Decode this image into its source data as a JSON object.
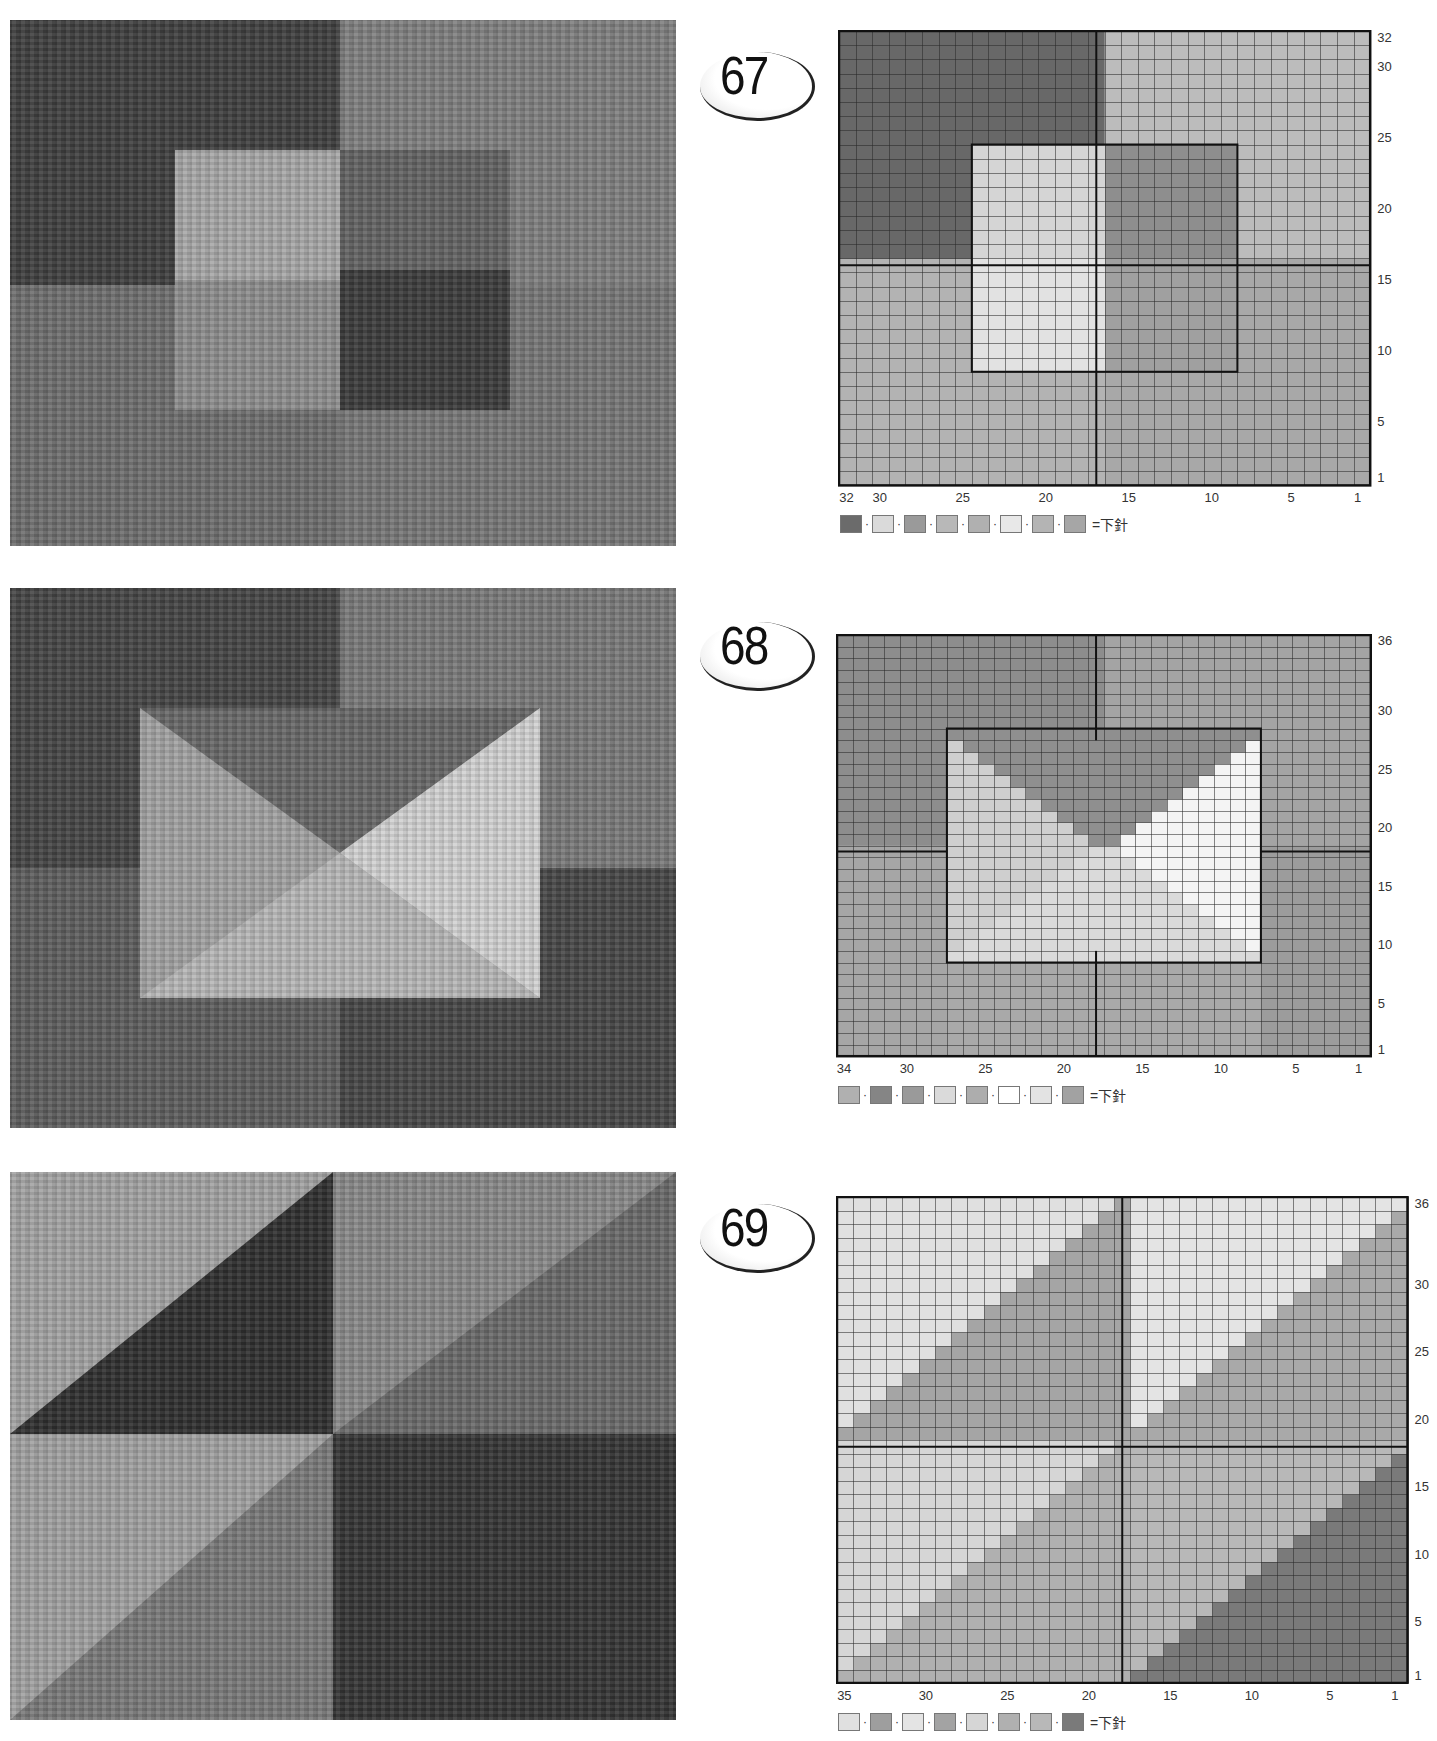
{
  "photos": [
    {
      "id": "photo-67",
      "top": 20,
      "height": 526,
      "blocks": [
        {
          "x": 0,
          "y": 0,
          "w": 330,
          "h": 265,
          "c": "#3f3f3f"
        },
        {
          "x": 330,
          "y": 0,
          "w": 336,
          "h": 265,
          "c": "#808080"
        },
        {
          "x": 0,
          "y": 265,
          "w": 330,
          "h": 261,
          "c": "#6e6e6e"
        },
        {
          "x": 330,
          "y": 265,
          "w": 336,
          "h": 261,
          "c": "#777777"
        },
        {
          "x": 165,
          "y": 130,
          "w": 165,
          "h": 130,
          "c": "#a8a8a8"
        },
        {
          "x": 165,
          "y": 260,
          "w": 165,
          "h": 130,
          "c": "#8e8e8e"
        },
        {
          "x": 330,
          "y": 130,
          "w": 170,
          "h": 120,
          "c": "#636363"
        },
        {
          "x": 330,
          "y": 250,
          "w": 170,
          "h": 140,
          "c": "#3c3c3c"
        }
      ]
    },
    {
      "id": "photo-68",
      "top": 588,
      "height": 540,
      "blocks": [
        {
          "x": 0,
          "y": 0,
          "w": 330,
          "h": 280,
          "c": "#454545"
        },
        {
          "x": 330,
          "y": 0,
          "w": 336,
          "h": 280,
          "c": "#7a7a7a"
        },
        {
          "x": 0,
          "y": 280,
          "w": 330,
          "h": 260,
          "c": "#5e5e5e"
        },
        {
          "x": 330,
          "y": 280,
          "w": 336,
          "h": 260,
          "c": "#474747"
        },
        {
          "x": 130,
          "y": 120,
          "w": 400,
          "h": 290,
          "c": "#a3a3a3"
        }
      ],
      "triangles": [
        {
          "pts": "130,120 530,120 330,265",
          "c": "#686868"
        },
        {
          "pts": "530,120 530,410 330,265",
          "c": "#d2d2d2"
        },
        {
          "pts": "130,410 530,410 330,265",
          "c": "#b8b8b8"
        }
      ]
    },
    {
      "id": "photo-69",
      "top": 1172,
      "height": 548,
      "blocks": [
        {
          "x": 0,
          "y": 0,
          "w": 323,
          "h": 262,
          "c": "#2f2f2f"
        },
        {
          "x": 323,
          "y": 0,
          "w": 343,
          "h": 262,
          "c": "#6a6a6a"
        },
        {
          "x": 0,
          "y": 262,
          "w": 323,
          "h": 286,
          "c": "#7a7a7a"
        },
        {
          "x": 323,
          "y": 262,
          "w": 343,
          "h": 286,
          "c": "#353535"
        }
      ],
      "triangles": [
        {
          "pts": "0,0 323,0 0,262",
          "c": "#a4a4a4"
        },
        {
          "pts": "323,0 666,0 323,262",
          "c": "#8a8a8a"
        },
        {
          "pts": "0,262 323,262 0,548",
          "c": "#a2a2a2"
        }
      ]
    }
  ],
  "charts": [
    {
      "number": "67",
      "badge_top": 44,
      "left": 838,
      "top": 30,
      "cols": 32,
      "rows": 32,
      "cell_w": 16.6,
      "cell_h": 14.2,
      "y_labels": [
        "32",
        "30",
        "25",
        "20",
        "15",
        "10",
        "5",
        "1"
      ],
      "x_labels": [
        "32",
        "30",
        "25",
        "20",
        "15",
        "10",
        "5",
        "1"
      ],
      "background": "#b5b5b5",
      "regions": [
        {
          "c0": 1,
          "c1": 16,
          "r0": 1,
          "r1": 16,
          "color": "#a8a8a8"
        },
        {
          "c0": 17,
          "c1": 32,
          "r0": 1,
          "r1": 16,
          "color": "#b3b3b3"
        },
        {
          "c0": 17,
          "c1": 32,
          "r0": 17,
          "r1": 32,
          "color": "#686868"
        },
        {
          "c0": 1,
          "c1": 16,
          "r0": 17,
          "r1": 32,
          "color": "#bcbcbc"
        },
        {
          "c0": 9,
          "c1": 16,
          "r0": 9,
          "r1": 16,
          "color": "#a0a0a0"
        },
        {
          "c0": 17,
          "c1": 24,
          "r0": 9,
          "r1": 16,
          "color": "#e2e2e2"
        },
        {
          "c0": 9,
          "c1": 16,
          "r0": 17,
          "r1": 24,
          "color": "#8e8e8e"
        },
        {
          "c0": 17,
          "c1": 24,
          "r0": 17,
          "r1": 24,
          "color": "#d5d5d5"
        }
      ],
      "borders": [
        {
          "type": "h",
          "row": 16.5,
          "c0": 1,
          "c1": 32
        },
        {
          "type": "v",
          "col": 16.5,
          "r0": 1,
          "r1": 32
        },
        {
          "type": "rect",
          "c0": 9,
          "c1": 24,
          "r0": 9,
          "r1": 24
        }
      ],
      "legend": {
        "swatches": [
          "#6b6b6b",
          "#dadada",
          "#9a9a9a",
          "#b8b8b8",
          "#b0b0b0",
          "#e8e8e8",
          "#b4b4b4",
          "#a6a6a6"
        ],
        "equals_label": "=下針"
      }
    },
    {
      "number": "68",
      "badge_top": 614,
      "left": 836,
      "top": 634,
      "cols": 34,
      "rows": 36,
      "cell_w": 15.7,
      "cell_h": 11.7,
      "y_labels": [
        "36",
        "30",
        "25",
        "20",
        "15",
        "10",
        "5",
        "1"
      ],
      "x_labels": [
        "34",
        "30",
        "25",
        "20",
        "15",
        "10",
        "5",
        "1"
      ],
      "background": "#a9a9a9",
      "regions": [
        {
          "c0": 18,
          "c1": 34,
          "r0": 19,
          "r1": 36,
          "color": "#8d8d8d"
        },
        {
          "c0": 1,
          "c1": 17,
          "r0": 19,
          "r1": 36,
          "color": "#a4a4a4"
        },
        {
          "c0": 1,
          "c1": 7,
          "r0": 1,
          "r1": 18,
          "color": "#9c9c9c"
        },
        {
          "c0": 28,
          "c1": 34,
          "r0": 1,
          "r1": 18,
          "color": "#a6a6a6"
        }
      ],
      "shape68": {
        "c0": 8,
        "c1": 27,
        "r0": 9,
        "r1": 28,
        "top_color": "#8f8f8f",
        "left_color": "#cfcfcf",
        "right_color": "#f4f4f4",
        "bottom_color": "#dadada"
      },
      "borders": [
        {
          "type": "h",
          "row": 18.5,
          "c0": 1,
          "c1": 7
        },
        {
          "type": "h",
          "row": 18.5,
          "c0": 28,
          "c1": 34
        },
        {
          "type": "v",
          "col": 17.5,
          "r0": 28,
          "r1": 36
        },
        {
          "type": "v",
          "col": 17.5,
          "r0": 1,
          "r1": 9
        }
      ],
      "legend": {
        "swatches": [
          "#b0b0b0",
          "#858585",
          "#9a9a9a",
          "#dadada",
          "#adadad",
          "#ffffff",
          "#e3e3e3",
          "#a2a2a2"
        ],
        "equals_label": "=下針"
      }
    },
    {
      "number": "69",
      "badge_top": 1196,
      "left": 836,
      "top": 1196,
      "cols": 35,
      "rows": 36,
      "cell_w": 16.3,
      "cell_h": 13.5,
      "y_labels": [
        "36",
        "30",
        "25",
        "20",
        "15",
        "10",
        "5",
        "1"
      ],
      "x_labels": [
        "35",
        "30",
        "25",
        "20",
        "15",
        "10",
        "5",
        "1"
      ],
      "background": "#a8a8a8",
      "quadrants": [
        {
          "c0": 18,
          "c1": 35,
          "r0": 19,
          "r1": 36,
          "light": "#e0e0e0",
          "dark": "#a5a5a5"
        },
        {
          "c0": 1,
          "c1": 17,
          "r0": 19,
          "r1": 36,
          "light": "#e4e4e4",
          "dark": "#a9a9a9"
        },
        {
          "c0": 18,
          "c1": 35,
          "r0": 1,
          "r1": 18,
          "light": "#d6d6d6",
          "dark": "#b0b0b0"
        },
        {
          "c0": 1,
          "c1": 17,
          "r0": 1,
          "r1": 18,
          "light": "#b8b8b8",
          "dark": "#7a7a7a"
        }
      ],
      "legend": {
        "swatches": [
          "#e0e0e0",
          "#9e9e9e",
          "#e4e4e4",
          "#a3a3a3",
          "#d6d6d6",
          "#b0b0b0",
          "#b8b8b8",
          "#7a7a7a"
        ],
        "equals_label": "=下針"
      }
    }
  ]
}
